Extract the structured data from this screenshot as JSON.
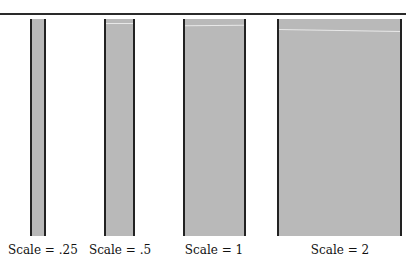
{
  "figure": {
    "bars": [
      {
        "label": "Scale = .25",
        "scale": 0.25,
        "left": 30,
        "width": 16,
        "top": 19,
        "bottom": 236,
        "highlight": null
      },
      {
        "label": "Scale = .5",
        "scale": 0.5,
        "left": 104,
        "width": 31,
        "top": 19,
        "bottom": 236,
        "highlight": 24
      },
      {
        "label": "Scale = 1",
        "scale": 1,
        "left": 183,
        "width": 63,
        "top": 19,
        "bottom": 236,
        "highlight": 27
      },
      {
        "label": "Scale = 2",
        "scale": 2,
        "left": 277,
        "width": 125,
        "top": 19,
        "bottom": 236,
        "highlight": 30
      }
    ],
    "colors": {
      "fill": "#b9b9b9",
      "border": "#222222",
      "line": "#2a2a2a"
    }
  }
}
